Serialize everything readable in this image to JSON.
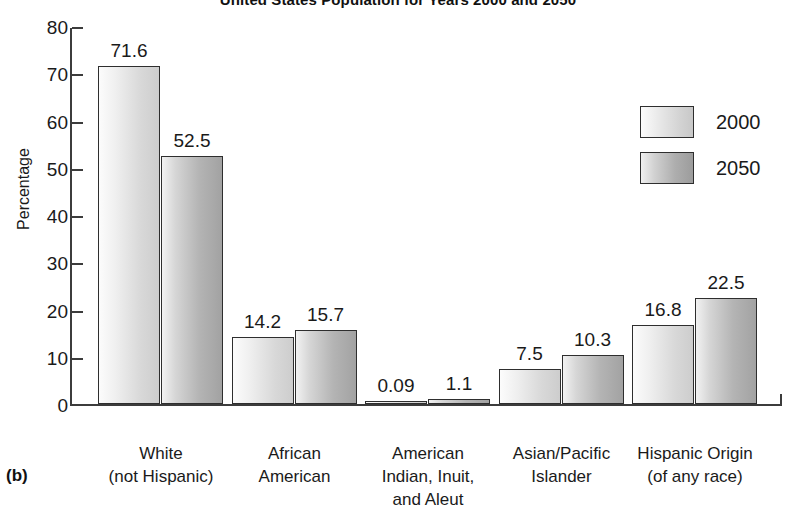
{
  "figure": {
    "panel_label": "(b)"
  },
  "chart_data": {
    "type": "bar",
    "title": "United States Population for Years 2000 and 2050",
    "xlabel": "",
    "ylabel": "Percentage",
    "ylim": [
      0,
      80
    ],
    "yticks": [
      0,
      10,
      20,
      30,
      40,
      50,
      60,
      70,
      80
    ],
    "grid": false,
    "legend_position": "upper right",
    "categories": [
      "White\n(not Hispanic)",
      "African\nAmerican",
      "American\nIndian, Inuit,\nand Aleut",
      "Asian/Pacific\nIslander",
      "Hispanic Origin\n(of any race)"
    ],
    "category_lines": [
      [
        "White",
        "(not Hispanic)"
      ],
      [
        "African",
        "American"
      ],
      [
        "American",
        "Indian, Inuit,",
        "and Aleut"
      ],
      [
        "Asian/Pacific",
        "Islander"
      ],
      [
        "Hispanic Origin",
        "(of any race)"
      ]
    ],
    "series": [
      {
        "name": "2000",
        "color": "#d8d8d8",
        "values": [
          71.6,
          14.2,
          0.09,
          7.5,
          16.8
        ],
        "value_labels": [
          "71.6",
          "14.2",
          "0.09",
          "7.5",
          "16.8"
        ]
      },
      {
        "name": "2050",
        "color": "#b0b0b0",
        "values": [
          52.5,
          15.7,
          1.1,
          10.3,
          22.5
        ],
        "value_labels": [
          "52.5",
          "15.7",
          "1.1",
          "10.3",
          "22.5"
        ]
      }
    ]
  }
}
